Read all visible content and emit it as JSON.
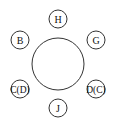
{
  "diagram": {
    "type": "round-table-seating",
    "table": {
      "cx": 58,
      "cy": 64,
      "r": 26,
      "stroke": "#333333",
      "fill": "#ffffff"
    },
    "seats": [
      {
        "id": "seat-top",
        "label": "H",
        "cx": 58,
        "cy": 19,
        "r": 9
      },
      {
        "id": "seat-upper-left",
        "label": "B",
        "cx": 20,
        "cy": 40,
        "r": 9
      },
      {
        "id": "seat-upper-right",
        "label": "G",
        "cx": 96,
        "cy": 40,
        "r": 9
      },
      {
        "id": "seat-lower-left",
        "label": "C(D)",
        "cx": 20,
        "cy": 89,
        "r": 9
      },
      {
        "id": "seat-lower-right",
        "label": "D(C)",
        "cx": 96,
        "cy": 89,
        "r": 9
      },
      {
        "id": "seat-bottom",
        "label": "J",
        "cx": 58,
        "cy": 108,
        "r": 9
      }
    ],
    "colors": {
      "stroke": "#333333",
      "text": "#111111",
      "background": "#ffffff"
    }
  }
}
